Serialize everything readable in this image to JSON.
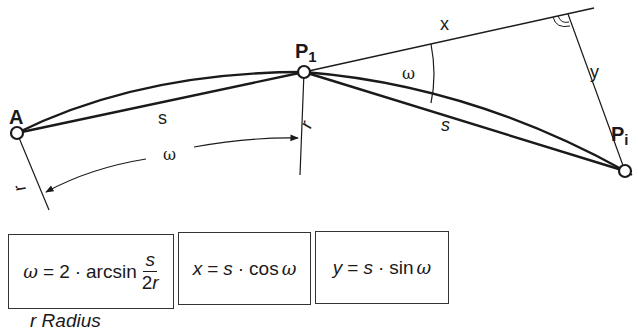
{
  "diagram": {
    "points": {
      "A": {
        "label": "A",
        "x": 17,
        "y": 133
      },
      "P1": {
        "label": "P",
        "subscript": "1",
        "x": 304,
        "y": 72
      },
      "Pi": {
        "label": "P",
        "subscript": "i",
        "x": 625,
        "y": 171
      }
    },
    "labels": {
      "chord_s_left": "s",
      "chord_s_right": "s",
      "omega_arc": "ω",
      "omega_angle": "ω",
      "tangent_x": "x",
      "offset_y": "y",
      "radius_left": "r",
      "radius_right": "r"
    }
  },
  "formulas": [
    {
      "id": "omega",
      "lhs": "ω",
      "eq": "=",
      "coef": "2",
      "dot": "·",
      "func": "arcsin",
      "numerator": "s",
      "denominator_num": "2",
      "denominator_var": "r"
    },
    {
      "id": "x",
      "lhs": "x",
      "eq": "=",
      "var": "s",
      "dot": "·",
      "func": "cos",
      "arg": "ω"
    },
    {
      "id": "y",
      "lhs": "y",
      "eq": "=",
      "var": "s",
      "dot": "·",
      "func": "sin",
      "arg": "ω"
    }
  ],
  "caption": {
    "partial_text": "r   Radius"
  }
}
